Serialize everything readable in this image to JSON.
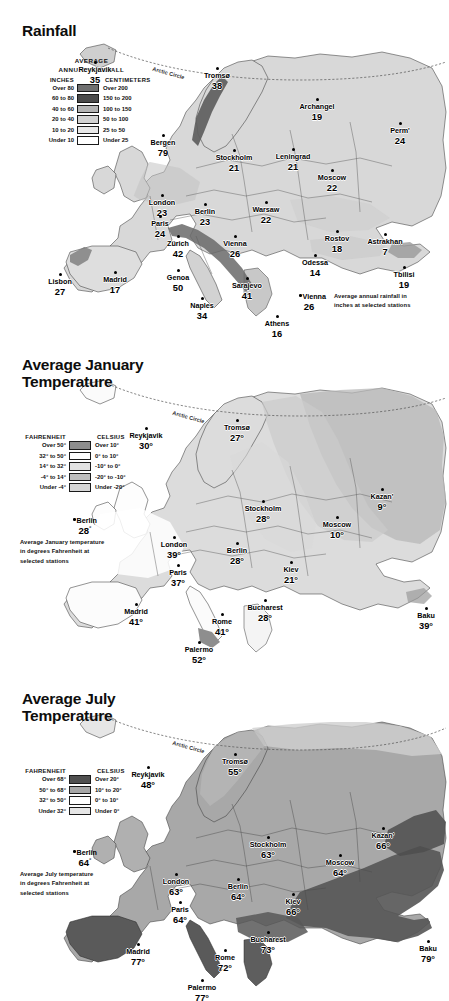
{
  "page": {
    "width": 449,
    "height": 1001,
    "background": "#ffffff"
  },
  "panels": [
    {
      "id": "rainfall",
      "title": "Rainfall",
      "legend": {
        "heading_line1": "AVERAGE",
        "heading_line2": "ANNUAL RAINFALL",
        "col_left_header": "INCHES",
        "col_right_header": "CENTIMETERS",
        "rows": [
          {
            "left": "Over 80",
            "right": "Over 200",
            "color": "#6f6f6f"
          },
          {
            "left": "60 to 80",
            "right": "150 to 200",
            "color": "#4a4a4a"
          },
          {
            "left": "40 to 60",
            "right": "100 to 150",
            "color": "#b4b4b4"
          },
          {
            "left": "20 to 40",
            "right": "50 to 100",
            "color": "#d2d2d2"
          },
          {
            "left": "10 to 20",
            "right": "25 to 50",
            "color": "#e8e8e8"
          },
          {
            "left": "Under 10",
            "right": "Under 25",
            "color": "#ffffff"
          }
        ]
      },
      "key": {
        "city": "Vienna",
        "value": "26",
        "note_line1": "Average annual rainfall in",
        "note_line2": "inches at selected stations"
      },
      "arctic_circle_label": "Arctic Circle",
      "unit_suffix": "",
      "cities": [
        {
          "name": "Reykjavik",
          "value": "35",
          "x": 95,
          "y": 58,
          "dx": 0,
          "dy": 0,
          "align": "center"
        },
        {
          "name": "Tromsø",
          "value": "38",
          "x": 217,
          "y": 64,
          "align": "center"
        },
        {
          "name": "Archangel",
          "value": "19",
          "x": 317,
          "y": 95,
          "align": "center"
        },
        {
          "name": "Perm'",
          "value": "24",
          "x": 400,
          "y": 119,
          "align": "center"
        },
        {
          "name": "Bergen",
          "value": "79",
          "x": 163,
          "y": 131,
          "align": "center"
        },
        {
          "name": "Stockholm",
          "value": "21",
          "x": 234,
          "y": 146,
          "align": "center"
        },
        {
          "name": "Leningrad",
          "value": "21",
          "x": 293,
          "y": 145,
          "align": "center"
        },
        {
          "name": "Moscow",
          "value": "22",
          "x": 332,
          "y": 166,
          "align": "center"
        },
        {
          "name": "London",
          "value": "23",
          "x": 162,
          "y": 191,
          "align": "center"
        },
        {
          "name": "Berlin",
          "value": "23",
          "x": 205,
          "y": 200,
          "align": "center"
        },
        {
          "name": "Warsaw",
          "value": "22",
          "x": 266,
          "y": 198,
          "align": "center"
        },
        {
          "name": "Paris",
          "value": "24",
          "x": 160,
          "y": 212,
          "align": "center"
        },
        {
          "name": "Zürich",
          "value": "42",
          "x": 178,
          "y": 232,
          "align": "center"
        },
        {
          "name": "Vienna",
          "value": "26",
          "x": 235,
          "y": 232,
          "align": "center"
        },
        {
          "name": "Rostov",
          "value": "18",
          "x": 337,
          "y": 227,
          "align": "center"
        },
        {
          "name": "Astrakhan",
          "value": "7",
          "x": 385,
          "y": 230,
          "align": "center"
        },
        {
          "name": "Odessa",
          "value": "14",
          "x": 315,
          "y": 251,
          "align": "center"
        },
        {
          "name": "Genoa",
          "value": "50",
          "x": 178,
          "y": 266,
          "align": "center"
        },
        {
          "name": "Lisbon",
          "value": "27",
          "x": 60,
          "y": 270,
          "align": "center"
        },
        {
          "name": "Madrid",
          "value": "17",
          "x": 115,
          "y": 268,
          "align": "center"
        },
        {
          "name": "Sarajevo",
          "value": "41",
          "x": 247,
          "y": 274,
          "align": "center"
        },
        {
          "name": "Tbilisi",
          "value": "19",
          "x": 404,
          "y": 263,
          "align": "center"
        },
        {
          "name": "Naples",
          "value": "34",
          "x": 202,
          "y": 294,
          "align": "center"
        },
        {
          "name": "Athens",
          "value": "16",
          "x": 277,
          "y": 312,
          "align": "center"
        }
      ]
    },
    {
      "id": "january",
      "title": "Average January\nTemperature",
      "title_line1": "Average January",
      "title_line2": "Temperature",
      "legend": {
        "heading_line1": "",
        "heading_line2": "",
        "col_left_header": "FAHRENHEIT",
        "col_right_header": "CELSIUS",
        "rows": [
          {
            "left": "Over 50°",
            "right": "Over 10°",
            "color": "#8e8e8e"
          },
          {
            "left": "32° to 50°",
            "right": "0° to 10°",
            "color": "#ffffff"
          },
          {
            "left": "14° to 32°",
            "right": "-10° to 0°",
            "color": "#e2e2e2"
          },
          {
            "left": "-4° to 14°",
            "right": "-20° to -10°",
            "color": "#bdbdbd"
          },
          {
            "left": "Under -4°",
            "right": "Under -20°",
            "color": "#d6d6d6"
          }
        ]
      },
      "key": {
        "city": "Berlin",
        "value": "28",
        "note_line1": "Average January temperature",
        "note_line2": "in degrees Fahrenheit at",
        "note_line3": "selected stations"
      },
      "arctic_circle_label": "Arctic Circle",
      "unit_suffix": "°",
      "cities": [
        {
          "name": "Reykjavik",
          "value": "30",
          "x": 146,
          "y": 424
        },
        {
          "name": "Tromsø",
          "value": "27",
          "x": 237,
          "y": 416
        },
        {
          "name": "Kazan'",
          "value": "9",
          "x": 382,
          "y": 485
        },
        {
          "name": "Stockholm",
          "value": "28",
          "x": 263,
          "y": 497
        },
        {
          "name": "Moscow",
          "value": "10",
          "x": 337,
          "y": 513
        },
        {
          "name": "London",
          "value": "39",
          "x": 174,
          "y": 533
        },
        {
          "name": "Berlin",
          "value": "28",
          "x": 237,
          "y": 539
        },
        {
          "name": "Kiev",
          "value": "21",
          "x": 291,
          "y": 558
        },
        {
          "name": "Paris",
          "value": "37",
          "x": 178,
          "y": 561
        },
        {
          "name": "Bucharest",
          "value": "28",
          "x": 265,
          "y": 596
        },
        {
          "name": "Madrid",
          "value": "41",
          "x": 136,
          "y": 600
        },
        {
          "name": "Baku",
          "value": "39",
          "x": 426,
          "y": 604
        },
        {
          "name": "Rome",
          "value": "41",
          "x": 222,
          "y": 610
        },
        {
          "name": "Palermo",
          "value": "52",
          "x": 199,
          "y": 638
        }
      ]
    },
    {
      "id": "july",
      "title": "Average July\nTemperature",
      "title_line1": "Average July",
      "title_line2": "Temperature",
      "legend": {
        "heading_line1": "",
        "heading_line2": "",
        "col_left_header": "FAHRENHEIT",
        "col_right_header": "CELSIUS",
        "rows": [
          {
            "left": "Over 68°",
            "right": "Over 20°",
            "color": "#4f4f4f"
          },
          {
            "left": "50° to 68°",
            "right": "10° to 20°",
            "color": "#a8a8a8"
          },
          {
            "left": "32° to 50°",
            "right": "0° to 10°",
            "color": "#ffffff"
          },
          {
            "left": "Under 32°",
            "right": "Under 0°",
            "color": "#e6e6e6"
          }
        ]
      },
      "key": {
        "city": "Berlin",
        "value": "64",
        "note_line1": "Average July temperature",
        "note_line2": "in degrees Fahrenheit at",
        "note_line3": "selected stations"
      },
      "arctic_circle_label": "Arctic Circle",
      "unit_suffix": "°",
      "cities": [
        {
          "name": "Reykjavik",
          "value": "48",
          "x": 148,
          "y": 763
        },
        {
          "name": "Tromsø",
          "value": "55",
          "x": 235,
          "y": 750
        },
        {
          "name": "Kazan'",
          "value": "66",
          "x": 383,
          "y": 824
        },
        {
          "name": "Stockholm",
          "value": "63",
          "x": 268,
          "y": 833
        },
        {
          "name": "Moscow",
          "value": "64",
          "x": 340,
          "y": 851
        },
        {
          "name": "London",
          "value": "63",
          "x": 176,
          "y": 870
        },
        {
          "name": "Berlin",
          "value": "64",
          "x": 238,
          "y": 875
        },
        {
          "name": "Kiev",
          "value": "66",
          "x": 293,
          "y": 890
        },
        {
          "name": "Paris",
          "value": "64",
          "x": 180,
          "y": 898
        },
        {
          "name": "Bucharest",
          "value": "73",
          "x": 268,
          "y": 928
        },
        {
          "name": "Madrid",
          "value": "77",
          "x": 138,
          "y": 940
        },
        {
          "name": "Baku",
          "value": "79",
          "x": 428,
          "y": 937
        },
        {
          "name": "Rome",
          "value": "72",
          "x": 225,
          "y": 946
        },
        {
          "name": "Palermo",
          "value": "77",
          "x": 202,
          "y": 976
        }
      ]
    }
  ],
  "chart_data": {
    "type": "map",
    "maps": [
      {
        "title": "Rainfall",
        "measure": "Average annual rainfall",
        "unit": "inches",
        "values": {
          "Reykjavik": 35,
          "Tromsø": 38,
          "Archangel": 19,
          "Perm'": 24,
          "Bergen": 79,
          "Stockholm": 21,
          "Leningrad": 21,
          "Moscow": 22,
          "London": 23,
          "Berlin": 23,
          "Warsaw": 22,
          "Paris": 24,
          "Zürich": 42,
          "Vienna": 26,
          "Rostov": 18,
          "Astrakhan": 7,
          "Odessa": 14,
          "Genoa": 50,
          "Lisbon": 27,
          "Madrid": 17,
          "Sarajevo": 41,
          "Tbilisi": 19,
          "Naples": 34,
          "Athens": 16
        },
        "classes_inches": [
          "Over 80",
          "60 to 80",
          "40 to 60",
          "20 to 40",
          "10 to 20",
          "Under 10"
        ],
        "classes_centimeters": [
          "Over 200",
          "150 to 200",
          "100 to 150",
          "50 to 100",
          "25 to 50",
          "Under 25"
        ]
      },
      {
        "title": "Average January Temperature",
        "measure": "Average January temperature",
        "unit": "degrees Fahrenheit",
        "values": {
          "Reykjavik": 30,
          "Tromsø": 27,
          "Kazan'": 9,
          "Stockholm": 28,
          "Moscow": 10,
          "London": 39,
          "Berlin": 28,
          "Kiev": 21,
          "Paris": 37,
          "Bucharest": 28,
          "Madrid": 41,
          "Baku": 39,
          "Rome": 41,
          "Palermo": 52
        },
        "classes_fahrenheit": [
          "Over 50°",
          "32° to 50°",
          "14° to 32°",
          "-4° to 14°",
          "Under -4°"
        ],
        "classes_celsius": [
          "Over 10°",
          "0° to 10°",
          "-10° to 0°",
          "-20° to -10°",
          "Under -20°"
        ]
      },
      {
        "title": "Average July Temperature",
        "measure": "Average July temperature",
        "unit": "degrees Fahrenheit",
        "values": {
          "Reykjavik": 48,
          "Tromsø": 55,
          "Kazan'": 66,
          "Stockholm": 63,
          "Moscow": 64,
          "London": 63,
          "Berlin": 64,
          "Kiev": 66,
          "Paris": 64,
          "Bucharest": 73,
          "Madrid": 77,
          "Baku": 79,
          "Rome": 72,
          "Palermo": 77
        },
        "classes_fahrenheit": [
          "Over 68°",
          "50° to 68°",
          "32° to 50°",
          "Under 32°"
        ],
        "classes_celsius": [
          "Over 20°",
          "10° to 20°",
          "0° to 10°",
          "Under 0°"
        ]
      }
    ]
  }
}
